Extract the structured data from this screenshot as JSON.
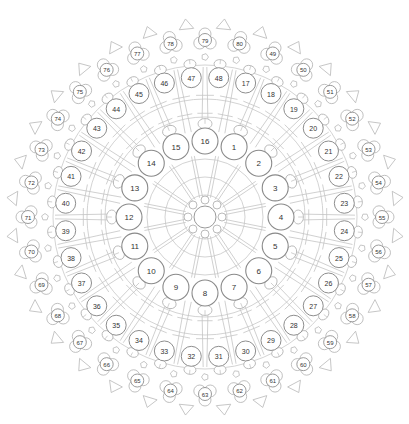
{
  "diagram": {
    "center": [
      205,
      217
    ],
    "hub": {
      "radius": 11,
      "ring_dots": 8,
      "ring_radius": 17,
      "dot_radius": 4
    },
    "rings": [
      {
        "name": "inner",
        "radius": 76,
        "circle_radius": 13,
        "font_size": 8,
        "start_angle_deg": -67.5,
        "step_deg": 22.5,
        "labels": [
          "1",
          "2",
          "3",
          "4",
          "5",
          "6",
          "7",
          "8",
          "9",
          "10",
          "11",
          "12",
          "13",
          "14",
          "15",
          "16"
        ]
      },
      {
        "name": "middle",
        "radius": 140,
        "circle_radius": 10,
        "font_size": 7,
        "start_angle_deg": -73.125,
        "step_deg": 11.25,
        "labels": [
          "17",
          "18",
          "19",
          "20",
          "21",
          "22",
          "23",
          "24",
          "25",
          "26",
          "27",
          "28",
          "29",
          "30",
          "31",
          "32",
          "33",
          "34",
          "35",
          "36",
          "37",
          "38",
          "39",
          "40",
          "41",
          "42",
          "43",
          "44",
          "45",
          "46",
          "47",
          "48"
        ]
      },
      {
        "name": "outer",
        "radius": 177,
        "circle_radius": 6.5,
        "font_size": 6,
        "start_angle_deg": -67.5,
        "step_deg": 11.25,
        "labels": [
          "49",
          "50",
          "51",
          "52",
          "53",
          "54",
          "55",
          "56",
          "57",
          "58",
          "59",
          "60",
          "61",
          "62",
          "63",
          "64",
          "65",
          "66",
          "67",
          "68",
          "69",
          "70",
          "71",
          "72",
          "73",
          "74",
          "75",
          "76",
          "77",
          "78",
          "79",
          "80"
        ]
      }
    ],
    "rim_triangles": {
      "count": 32,
      "radius": 193,
      "offset_deg": -84.375
    },
    "blobs": {
      "count": 32,
      "radius": 160,
      "offset_deg": -78.75
    },
    "colors": {
      "stroke": "#8e8e8e",
      "light_stroke": "#c4c4c4",
      "label": "#333333",
      "background": "#ffffff"
    }
  }
}
